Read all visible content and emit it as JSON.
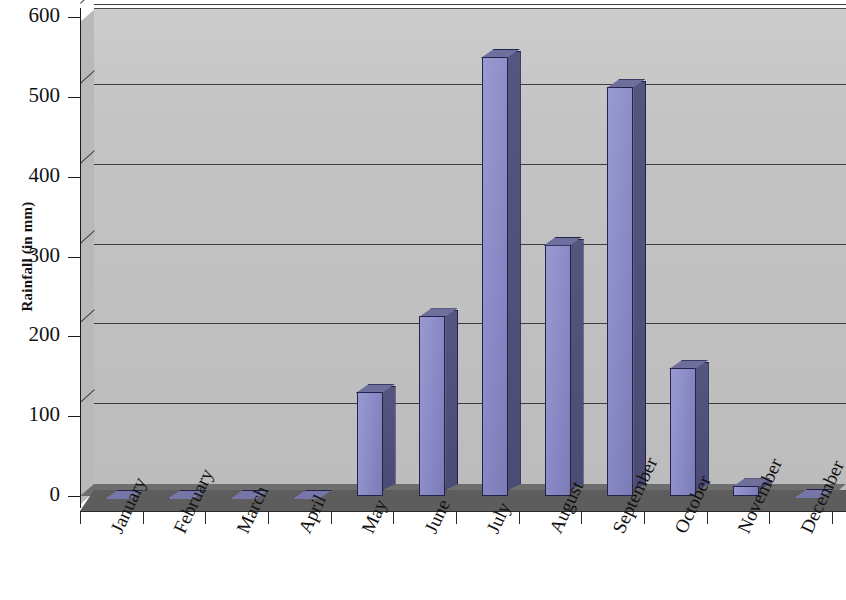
{
  "chart_data": {
    "type": "bar",
    "title": "",
    "xlabel": "",
    "ylabel": "Rainfall (in mm)",
    "ylim": [
      0,
      600
    ],
    "ytick_values": [
      0,
      100,
      200,
      300,
      400,
      500,
      600
    ],
    "ytick_labels": [
      "0",
      "100",
      "200",
      "300",
      "400",
      "500",
      "600"
    ],
    "grid": true,
    "legend": "none",
    "style": "3d-column",
    "categories": [
      "January",
      "February",
      "March",
      "April",
      "May",
      "June",
      "July",
      "August",
      "September",
      "October",
      "November",
      "December"
    ],
    "values": [
      0,
      0,
      0,
      0,
      130,
      225,
      550,
      315,
      512,
      160,
      12,
      2
    ],
    "series": [
      {
        "name": "Rainfall",
        "values": [
          0,
          0,
          0,
          0,
          130,
          225,
          550,
          315,
          512,
          160,
          12,
          2
        ]
      }
    ],
    "colors": {
      "bar_front": "#8c8cc8",
      "bar_side": "#4e4e78",
      "bar_top": "#6f6f9e",
      "bar_outline": "#22224a",
      "plot_wall": "#c3c3c3",
      "floor": "#5d5d5d",
      "gridline": "#3d3d3d",
      "axis": "#1a1a1a",
      "background": "#ffffff"
    }
  }
}
